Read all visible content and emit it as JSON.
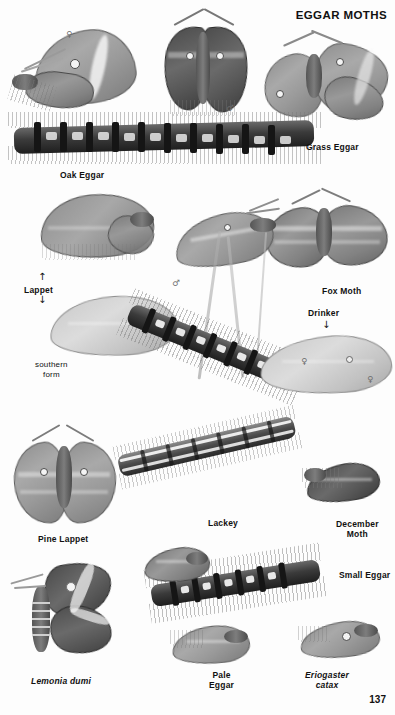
{
  "plate": {
    "title": "EGGAR MOTHS",
    "page_number": "137",
    "background_color": "#fdfdfd",
    "ink_color": "#111111"
  },
  "labels": [
    {
      "id": "oak-eggar",
      "text": "Oak Eggar",
      "style": "bold",
      "x": 60,
      "y": 170
    },
    {
      "id": "grass-eggar",
      "text": "Grass Eggar",
      "style": "bold",
      "x": 306,
      "y": 142
    },
    {
      "id": "lappet",
      "text": "Lappet",
      "style": "bold",
      "x": 24,
      "y": 285
    },
    {
      "id": "southern-form",
      "text": "southern\nform",
      "style": "plain",
      "x": 35,
      "y": 360
    },
    {
      "id": "fox-moth",
      "text": "Fox Moth",
      "style": "bold",
      "x": 322,
      "y": 286
    },
    {
      "id": "drinker",
      "text": "Drinker",
      "style": "bold",
      "x": 308,
      "y": 308
    },
    {
      "id": "pine-lappet",
      "text": "Pine Lappet",
      "style": "bold",
      "x": 38,
      "y": 534
    },
    {
      "id": "lackey",
      "text": "Lackey",
      "style": "bold",
      "x": 208,
      "y": 518
    },
    {
      "id": "december-moth",
      "text": "December\nMoth",
      "style": "bold",
      "x": 336,
      "y": 519
    },
    {
      "id": "small-eggar",
      "text": "Small Eggar",
      "style": "bold",
      "x": 339,
      "y": 570
    },
    {
      "id": "lemonia-dumi",
      "text": "Lemonia dumi",
      "style": "bold-italic",
      "x": 31,
      "y": 676
    },
    {
      "id": "pale-eggar",
      "text": "Pale\nEggar",
      "style": "bold",
      "x": 209,
      "y": 670
    },
    {
      "id": "eriogaster-catax",
      "text": "Eriogaster\ncatax",
      "style": "bold-italic",
      "x": 305,
      "y": 670
    }
  ],
  "arrows": [
    {
      "id": "lappet-arrow-up",
      "glyph": "↑",
      "x": 38,
      "y": 272
    },
    {
      "id": "lappet-arrow-down",
      "glyph": "↓",
      "x": 38,
      "y": 295
    },
    {
      "id": "drinker-arrow-down",
      "glyph": "↓",
      "x": 322,
      "y": 320
    }
  ],
  "sex_symbols": [
    {
      "id": "oak-eggar-female",
      "glyph": "♀",
      "x": 66,
      "y": 30,
      "tone": "light"
    },
    {
      "id": "oak-eggar-male",
      "glyph": "♂",
      "x": 226,
      "y": 104,
      "tone": "light"
    },
    {
      "id": "drinker-male",
      "glyph": "♂",
      "x": 172,
      "y": 279,
      "tone": "light"
    },
    {
      "id": "drinker-female",
      "glyph": "♀",
      "x": 367,
      "y": 375,
      "tone": "light"
    },
    {
      "id": "fox-moth-female",
      "glyph": "♀",
      "x": 301,
      "y": 357,
      "tone": "light"
    }
  ],
  "figures": [
    {
      "id": "oak-eggar-female-moth",
      "name": "Oak Eggar female moth",
      "kind": "moth-folded-wing"
    },
    {
      "id": "oak-eggar-male-moth",
      "name": "Oak Eggar male moth",
      "kind": "moth-dark-spread"
    },
    {
      "id": "grass-eggar-moth",
      "name": "Grass Eggar moth",
      "kind": "moth-spread"
    },
    {
      "id": "oak-eggar-caterpillar",
      "name": "Oak Eggar caterpillar",
      "kind": "caterpillar-hairy-banded"
    },
    {
      "id": "lappet-moth",
      "name": "Lappet moth",
      "kind": "moth-leaflike"
    },
    {
      "id": "lappet-southern-form",
      "name": "Lappet southern form",
      "kind": "wing-pale"
    },
    {
      "id": "fox-moth-moth",
      "name": "Fox Moth",
      "kind": "moth-spread"
    },
    {
      "id": "drinker-moth",
      "name": "Drinker male moth",
      "kind": "moth-resting"
    },
    {
      "id": "drinker-female-wing",
      "name": "Drinker female wing",
      "kind": "wing-pale"
    },
    {
      "id": "drinker-caterpillar",
      "name": "Drinker caterpillar",
      "kind": "caterpillar-hairy-dark"
    },
    {
      "id": "pine-lappet-moth",
      "name": "Pine Lappet moth",
      "kind": "moth-spread"
    },
    {
      "id": "lackey-caterpillar",
      "name": "Lackey caterpillar",
      "kind": "caterpillar-striped"
    },
    {
      "id": "december-moth-moth",
      "name": "December Moth",
      "kind": "moth-resting"
    },
    {
      "id": "small-eggar-caterpillar",
      "name": "Small Eggar caterpillar",
      "kind": "caterpillar-hairy-dark"
    },
    {
      "id": "small-eggar-moth",
      "name": "Small Eggar moth",
      "kind": "moth-resting"
    },
    {
      "id": "lemonia-dumi-moth",
      "name": "Lemonia dumi moth",
      "kind": "moth-banded-spread"
    },
    {
      "id": "pale-eggar-moth",
      "name": "Pale Eggar moth",
      "kind": "moth-resting"
    },
    {
      "id": "eriogaster-catax-moth",
      "name": "Eriogaster catax moth",
      "kind": "moth-resting"
    }
  ]
}
